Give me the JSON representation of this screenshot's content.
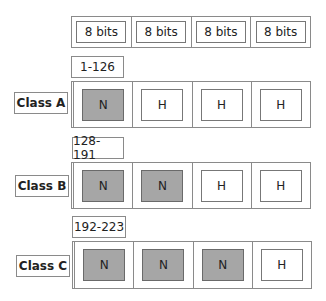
{
  "header": {
    "cells": [
      "8 bits",
      "8 bits",
      "8 bits",
      "8 bits"
    ]
  },
  "classes": [
    {
      "name": "Class A",
      "range": "1-126",
      "octets": [
        "N",
        "H",
        "H",
        "H"
      ]
    },
    {
      "name": "Class B",
      "range": "128-191",
      "octets": [
        "N",
        "N",
        "H",
        "H"
      ]
    },
    {
      "name": "Class C",
      "range": "192-223",
      "octets": [
        "N",
        "N",
        "N",
        "H"
      ]
    }
  ],
  "colors": {
    "network_fill": "#a6a6a6",
    "host_fill": "#ffffff",
    "border": "#8a8a8a"
  }
}
